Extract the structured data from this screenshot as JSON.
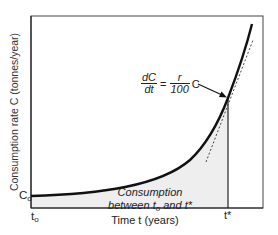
{
  "diagram": {
    "type": "exponential-growth-curve",
    "axes": {
      "y_label": "Consumption rate C (tonnes/year)",
      "x_label": "Time t (years)",
      "y_tick": {
        "base": "C",
        "sub": "o"
      },
      "x_ticks": [
        {
          "base": "t",
          "sub": "o"
        },
        {
          "base": "t*",
          "sub": ""
        }
      ]
    },
    "equation": {
      "lhs_num": "dC",
      "lhs_den": "dt",
      "equals": "=",
      "rhs_num": "r",
      "rhs_den": "100",
      "rhs_var": "C"
    },
    "area_label": {
      "line1": "Consumption",
      "line2_prefix": "between t",
      "line2_sub": "o",
      "line2_suffix": " and t*"
    },
    "colors": {
      "curve": "#111111",
      "frame": "#333333",
      "shaded_area": "#eeeeee",
      "tangent": "#444444"
    }
  }
}
